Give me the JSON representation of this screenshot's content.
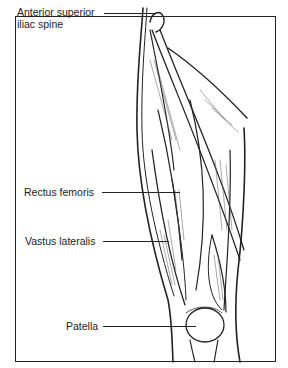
{
  "diagram": {
    "labels": [
      {
        "id": "asis",
        "line1": "Anterior superior",
        "line2": "iliac spine"
      },
      {
        "id": "rectus",
        "text": "Rectus femoris"
      },
      {
        "id": "vastus",
        "text": "Vastus lateralis"
      },
      {
        "id": "patella",
        "text": "Patella"
      }
    ]
  },
  "colors": {
    "ink": "#222222",
    "paper": "#ffffff"
  }
}
